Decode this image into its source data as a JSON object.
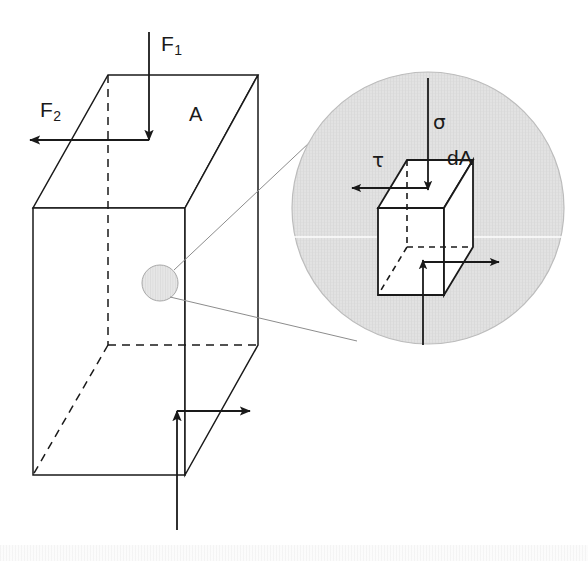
{
  "figure": {
    "background_color": "#ffffff",
    "line_color": "#1a1a1a",
    "leader_line_color": "#8c8c8c",
    "inset_fill_color": "#dcdcdc",
    "width": 588,
    "height": 561
  },
  "labels": {
    "force_axial": "F",
    "force_axial_sub": "1",
    "force_shear": "F",
    "force_shear_sub": "2",
    "area": "A",
    "normal_stress": "σ",
    "shear_stress": "τ",
    "differential_area": "dA"
  },
  "main_body": {
    "name": "rectangular-prism",
    "top_face": {
      "back_left": [
        108,
        75
      ],
      "back_right": [
        258,
        75
      ],
      "front_right": [
        185,
        208
      ],
      "front_left": [
        33,
        208
      ]
    },
    "front_face": {
      "top_left": [
        33,
        208
      ],
      "top_right": [
        185,
        208
      ],
      "bottom_right": [
        185,
        475
      ],
      "bottom_left": [
        33,
        475
      ]
    },
    "right_face": {
      "top_back": [
        258,
        75
      ],
      "top_front": [
        185,
        208
      ],
      "bottom_front": [
        185,
        475
      ],
      "bottom_back": [
        258,
        345
      ]
    },
    "hidden_edges": "dashed",
    "section_marker_circle": {
      "cx": 160,
      "cy": 283,
      "r": 18
    }
  },
  "applied_forces": [
    {
      "name": "F1",
      "direction": "down",
      "from": [
        149,
        32
      ],
      "to": [
        149,
        140
      ],
      "description": "axial compressive force on top face"
    },
    {
      "name": "F2",
      "direction": "left",
      "from": [
        149,
        140
      ],
      "to": [
        30,
        140
      ],
      "description": "transverse shear force on top face"
    }
  ],
  "reaction_forces": [
    {
      "name": "R1",
      "direction": "up",
      "from": [
        177,
        530
      ],
      "to": [
        177,
        411
      ],
      "description": "vertical reaction at base"
    },
    {
      "name": "R2",
      "direction": "right",
      "from": [
        177,
        411
      ],
      "to": [
        250,
        411
      ],
      "description": "horizontal reaction at base"
    }
  ],
  "inset": {
    "name": "magnified-detail",
    "circle": {
      "cx": 428,
      "cy": 208,
      "r": 136
    },
    "leader_lines": [
      {
        "from": [
          174,
          270
        ],
        "to": [
          325,
          128
        ]
      },
      {
        "from": [
          170,
          297
        ],
        "to": [
          355,
          340
        ]
      }
    ],
    "element": {
      "name": "differential-cube",
      "top_face": {
        "back_left": [
          407,
          160
        ],
        "back_right": [
          473,
          160
        ],
        "front_right": [
          444,
          208
        ],
        "front_left": [
          378,
          208
        ]
      },
      "front_face": {
        "top_left": [
          378,
          208
        ],
        "top_right": [
          444,
          208
        ],
        "bottom_right": [
          444,
          295
        ],
        "bottom_left": [
          378,
          295
        ]
      },
      "right_face": {
        "top_back": [
          473,
          160
        ],
        "top_front": [
          444,
          208
        ],
        "bottom_front": [
          444,
          295
        ],
        "bottom_back": [
          473,
          247
        ]
      }
    },
    "stress_arrows": [
      {
        "name": "sigma",
        "direction": "down",
        "from": [
          428,
          78
        ],
        "to": [
          428,
          188
        ],
        "description": "normal stress acting perpendicular to dA"
      },
      {
        "name": "tau",
        "direction": "left",
        "from": [
          428,
          188
        ],
        "to": [
          350,
          188
        ],
        "description": "shear stress acting tangent to dA"
      },
      {
        "name": "sigma-reaction",
        "direction": "up",
        "from": [
          423,
          345
        ],
        "to": [
          423,
          262
        ],
        "description": "equal and opposite normal stress"
      },
      {
        "name": "tau-reaction",
        "direction": "right",
        "from": [
          423,
          262
        ],
        "to": [
          497,
          262
        ],
        "description": "equal and opposite shear stress"
      }
    ]
  },
  "label_positions": {
    "F1": [
      163,
      35
    ],
    "F2": [
      42,
      100
    ],
    "A": [
      190,
      103
    ],
    "sigma": [
      434,
      113
    ],
    "tau": [
      373,
      150
    ],
    "dA": [
      448,
      148
    ]
  }
}
